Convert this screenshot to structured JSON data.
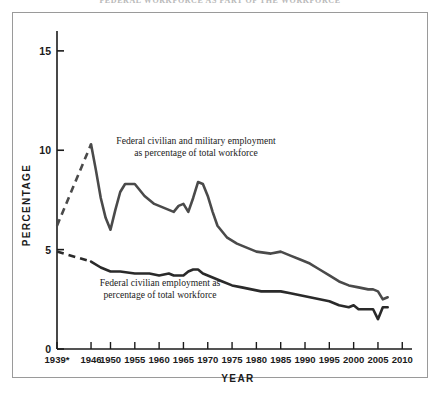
{
  "figure": {
    "clipped_header_text": "FEDERAL WORKFORCE AS PART OF THE WORKFORCE"
  },
  "chart_data": {
    "type": "line",
    "title": "",
    "xlabel": "YEAR",
    "ylabel": "PERCENTAGE",
    "xlim": [
      1939,
      2012
    ],
    "ylim": [
      0,
      16
    ],
    "yticks": [
      0,
      5,
      10,
      15
    ],
    "yticklabels": [
      "0",
      "5",
      "10",
      "15"
    ],
    "xticks": [
      1939,
      1946,
      1950,
      1955,
      1960,
      1965,
      1970,
      1975,
      1980,
      1985,
      1990,
      1995,
      2000,
      2005,
      2010
    ],
    "xticklabels": [
      "1939*",
      "1946",
      "1950",
      "1955",
      "1960",
      "1965",
      "1970",
      "1975",
      "1980",
      "1985",
      "1990",
      "1995",
      "2000",
      "2005",
      "2010"
    ],
    "grid": false,
    "legend": "none",
    "series": [
      {
        "name": "Federal civilian and military employment as percentage of total workforce",
        "color": "#4a4a4a",
        "annotation": "Federal civilian and military employment\nas percentage of total workforce",
        "annotation_line1": "Federal civilian and military employment",
        "annotation_line2": "as percentage of total workforce",
        "dashed_segment": [
          {
            "x": 1939,
            "y": 6.2
          },
          {
            "x": 1946,
            "y": 10.3
          }
        ],
        "points": [
          {
            "x": 1946,
            "y": 10.3
          },
          {
            "x": 1947,
            "y": 9.0
          },
          {
            "x": 1948,
            "y": 7.6
          },
          {
            "x": 1949,
            "y": 6.6
          },
          {
            "x": 1950,
            "y": 6.0
          },
          {
            "x": 1951,
            "y": 7.0
          },
          {
            "x": 1952,
            "y": 7.9
          },
          {
            "x": 1953,
            "y": 8.3
          },
          {
            "x": 1955,
            "y": 8.3
          },
          {
            "x": 1957,
            "y": 7.7
          },
          {
            "x": 1959,
            "y": 7.3
          },
          {
            "x": 1961,
            "y": 7.1
          },
          {
            "x": 1963,
            "y": 6.9
          },
          {
            "x": 1964,
            "y": 7.2
          },
          {
            "x": 1965,
            "y": 7.3
          },
          {
            "x": 1966,
            "y": 6.9
          },
          {
            "x": 1967,
            "y": 7.6
          },
          {
            "x": 1968,
            "y": 8.4
          },
          {
            "x": 1969,
            "y": 8.3
          },
          {
            "x": 1970,
            "y": 7.7
          },
          {
            "x": 1971,
            "y": 6.9
          },
          {
            "x": 1972,
            "y": 6.2
          },
          {
            "x": 1974,
            "y": 5.6
          },
          {
            "x": 1976,
            "y": 5.3
          },
          {
            "x": 1978,
            "y": 5.1
          },
          {
            "x": 1980,
            "y": 4.9
          },
          {
            "x": 1983,
            "y": 4.8
          },
          {
            "x": 1985,
            "y": 4.9
          },
          {
            "x": 1987,
            "y": 4.7
          },
          {
            "x": 1989,
            "y": 4.5
          },
          {
            "x": 1991,
            "y": 4.3
          },
          {
            "x": 1993,
            "y": 4.0
          },
          {
            "x": 1995,
            "y": 3.7
          },
          {
            "x": 1997,
            "y": 3.4
          },
          {
            "x": 1999,
            "y": 3.2
          },
          {
            "x": 2001,
            "y": 3.1
          },
          {
            "x": 2003,
            "y": 3.0
          },
          {
            "x": 2004,
            "y": 3.0
          },
          {
            "x": 2005,
            "y": 2.9
          },
          {
            "x": 2006,
            "y": 2.5
          },
          {
            "x": 2007,
            "y": 2.6
          }
        ]
      },
      {
        "name": "Federal civilian employment as percentage of total workforce",
        "color": "#2a2a2a",
        "annotation": "Federal civilian employment as\npercentage of total workforce",
        "annotation_line1": "Federal civilian employment as",
        "annotation_line2": "percentage of total workforce",
        "dashed_segment": [
          {
            "x": 1939,
            "y": 4.9
          },
          {
            "x": 1946,
            "y": 4.4
          }
        ],
        "points": [
          {
            "x": 1946,
            "y": 4.4
          },
          {
            "x": 1948,
            "y": 4.1
          },
          {
            "x": 1950,
            "y": 3.9
          },
          {
            "x": 1952,
            "y": 3.9
          },
          {
            "x": 1955,
            "y": 3.8
          },
          {
            "x": 1958,
            "y": 3.8
          },
          {
            "x": 1960,
            "y": 3.7
          },
          {
            "x": 1962,
            "y": 3.8
          },
          {
            "x": 1963,
            "y": 3.7
          },
          {
            "x": 1964,
            "y": 3.7
          },
          {
            "x": 1965,
            "y": 3.7
          },
          {
            "x": 1966,
            "y": 3.9
          },
          {
            "x": 1967,
            "y": 4.0
          },
          {
            "x": 1968,
            "y": 4.0
          },
          {
            "x": 1969,
            "y": 3.8
          },
          {
            "x": 1971,
            "y": 3.6
          },
          {
            "x": 1973,
            "y": 3.4
          },
          {
            "x": 1975,
            "y": 3.2
          },
          {
            "x": 1977,
            "y": 3.1
          },
          {
            "x": 1979,
            "y": 3.0
          },
          {
            "x": 1981,
            "y": 2.9
          },
          {
            "x": 1983,
            "y": 2.9
          },
          {
            "x": 1985,
            "y": 2.9
          },
          {
            "x": 1987,
            "y": 2.8
          },
          {
            "x": 1989,
            "y": 2.7
          },
          {
            "x": 1991,
            "y": 2.6
          },
          {
            "x": 1993,
            "y": 2.5
          },
          {
            "x": 1995,
            "y": 2.4
          },
          {
            "x": 1997,
            "y": 2.2
          },
          {
            "x": 1999,
            "y": 2.1
          },
          {
            "x": 2000,
            "y": 2.2
          },
          {
            "x": 2001,
            "y": 2.0
          },
          {
            "x": 2002,
            "y": 2.0
          },
          {
            "x": 2003,
            "y": 2.0
          },
          {
            "x": 2004,
            "y": 2.0
          },
          {
            "x": 2005,
            "y": 1.5
          },
          {
            "x": 2006,
            "y": 2.1
          },
          {
            "x": 2007,
            "y": 2.1
          }
        ]
      }
    ]
  }
}
